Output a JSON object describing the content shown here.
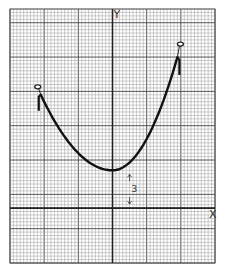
{
  "chart_data": {
    "type": "line",
    "title": "",
    "xlabel": "X",
    "ylabel": "Y",
    "grid": true,
    "grid_minor_per_major": 10,
    "xlim": [
      -30,
      30
    ],
    "ylim": [
      -16,
      58
    ],
    "curve": {
      "name": "parabola",
      "vertex": [
        0,
        11
      ],
      "shape": "opens-up",
      "left_endpoint": [
        -21,
        33
      ],
      "right_endpoint": [
        19,
        44
      ],
      "left_endpoint_marker": "open-circle",
      "right_endpoint_marker": "open-circle"
    },
    "annotations": [
      {
        "type": "dimension-arrow",
        "label": "3",
        "from_y": 0,
        "to_y": 11,
        "x": 5
      }
    ]
  },
  "labels": {
    "x_axis": "X",
    "y_axis": "Y",
    "vertex_offset": "3"
  },
  "colors": {
    "grid_minor": "#9a9a9a",
    "grid_major": "#444444",
    "curve": "#111111"
  }
}
